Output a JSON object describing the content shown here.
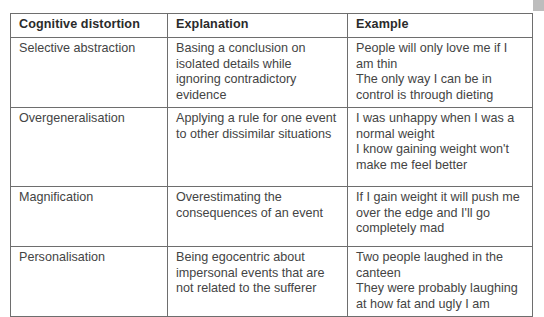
{
  "table": {
    "headers": [
      "Cognitive distortion",
      "Explanation",
      "Example"
    ],
    "rows": [
      {
        "distortion": "Selective abstraction",
        "explanation": "Basing a conclusion on isolated details while ignoring contradictory evidence",
        "examples": [
          "People will only love me if I am thin",
          "The only way I can be in control is through dieting"
        ]
      },
      {
        "distortion": "Overgeneralisation",
        "explanation": "Applying a rule for one event to other dissimilar situations",
        "examples": [
          "I was unhappy when I was a normal weight",
          "I know gaining weight won't make me feel better"
        ]
      },
      {
        "distortion": "Magnification",
        "explanation": "Overestimating the consequences of an event",
        "examples": [
          "If I gain weight it will push me over the edge and I'll go completely mad"
        ]
      },
      {
        "distortion": "Personalisation",
        "explanation": "Being egocentric about impersonal events that are not related to the sufferer",
        "examples": [
          "Two people laughed in the canteen",
          "They were probably laughing at how fat and ugly I am"
        ]
      }
    ]
  },
  "colors": {
    "border": "#6e6e6e",
    "text": "#444444",
    "corner_tab": "#bdbdbd"
  }
}
